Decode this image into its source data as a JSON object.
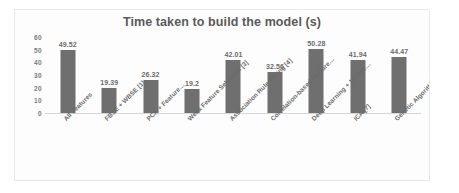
{
  "chart_data": {
    "type": "bar",
    "title": "Time taken to build the model (s)",
    "xlabel": "",
    "ylabel": "",
    "ylim": [
      0,
      60
    ],
    "yticks": [
      0,
      10,
      20,
      30,
      40,
      50,
      60
    ],
    "grid": false,
    "legend": false,
    "bar_color": "#6f6f6f",
    "categories": [
      "All Features",
      "FBSE + WBSE [1]",
      "PCA + Feature…",
      "Weka Feature Selection [3]",
      "Association Rule Mining [4]",
      "Correlation-based Feature…",
      "Deep Learning + 10-fold…",
      "ICA [7]",
      "Genetic Algorithm + SVM [8]"
    ],
    "values": [
      49.52,
      19.39,
      26.32,
      19.2,
      42.01,
      32.56,
      50.28,
      41.94,
      44.47
    ],
    "data_labels": [
      "49.52",
      "19.39",
      "26.32",
      "19.2",
      "42.01",
      "32.56",
      "50.28",
      "41.94",
      "44.47"
    ]
  }
}
